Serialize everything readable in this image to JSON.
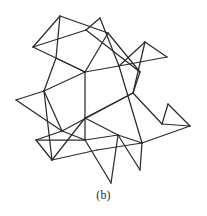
{
  "figure": {
    "caption": "(b)",
    "label": "(b)",
    "title": "",
    "kind": "geometric-line-network",
    "canvas": {
      "width": 207,
      "height": 216
    },
    "style": {
      "stroke_color": "#2b2b2b",
      "stroke_width": 1.25,
      "background_color": "#ffffff",
      "line_cap": "round",
      "line_join": "round"
    },
    "vertices": [
      {
        "id": "v1",
        "x": 60,
        "y": 16
      },
      {
        "id": "v2",
        "x": 100,
        "y": 18
      },
      {
        "id": "v3",
        "x": 33,
        "y": 47
      },
      {
        "id": "v4",
        "x": 86,
        "y": 30
      },
      {
        "id": "v5",
        "x": 108,
        "y": 33
      },
      {
        "id": "v6",
        "x": 145,
        "y": 42
      },
      {
        "id": "v7",
        "x": 167,
        "y": 57
      },
      {
        "id": "v8",
        "x": 140,
        "y": 72
      },
      {
        "id": "v9",
        "x": 56,
        "y": 58
      },
      {
        "id": "v10",
        "x": 85,
        "y": 72
      },
      {
        "id": "v11",
        "x": 119,
        "y": 66
      },
      {
        "id": "v12",
        "x": 16,
        "y": 100
      },
      {
        "id": "v13",
        "x": 44,
        "y": 91
      },
      {
        "id": "v14",
        "x": 133,
        "y": 93
      },
      {
        "id": "v15",
        "x": 85,
        "y": 118
      },
      {
        "id": "v16",
        "x": 168,
        "y": 104
      },
      {
        "id": "v17",
        "x": 190,
        "y": 126
      },
      {
        "id": "v18",
        "x": 162,
        "y": 124
      },
      {
        "id": "v19",
        "x": 36,
        "y": 140
      },
      {
        "id": "v20",
        "x": 85,
        "y": 140
      },
      {
        "id": "v21",
        "x": 118,
        "y": 135
      },
      {
        "id": "v22",
        "x": 62,
        "y": 131
      },
      {
        "id": "v23",
        "x": 52,
        "y": 160
      },
      {
        "id": "v24",
        "x": 97,
        "y": 150
      },
      {
        "id": "v25",
        "x": 111,
        "y": 183
      },
      {
        "id": "v26",
        "x": 140,
        "y": 170
      },
      {
        "id": "v27",
        "x": 142,
        "y": 143
      }
    ],
    "segments": [
      {
        "name": "top-left-triangle-left-edge",
        "x1": 60,
        "y1": 16,
        "x2": 33,
        "y2": 47
      },
      {
        "name": "top-left-triangle-right-edge",
        "x1": 60,
        "y1": 16,
        "x2": 108,
        "y2": 33
      },
      {
        "name": "top-left-triangle-base",
        "x1": 33,
        "y1": 47,
        "x2": 86,
        "y2": 30
      },
      {
        "name": "top-right-triangle-left-edge",
        "x1": 100,
        "y1": 18,
        "x2": 86,
        "y2": 30
      },
      {
        "name": "top-right-triangle-right-edge",
        "x1": 100,
        "y1": 18,
        "x2": 119,
        "y2": 66
      },
      {
        "name": "top-mid-cross-edge",
        "x1": 86,
        "y1": 30,
        "x2": 140,
        "y2": 72
      },
      {
        "name": "upper-left-spur",
        "x1": 60,
        "y1": 16,
        "x2": 56,
        "y2": 58
      },
      {
        "name": "left-diagonal-to-mid",
        "x1": 33,
        "y1": 47,
        "x2": 85,
        "y2": 72
      },
      {
        "name": "upper-left-to-lower-left",
        "x1": 56,
        "y1": 58,
        "x2": 44,
        "y2": 91
      },
      {
        "name": "mid-left-brace",
        "x1": 56,
        "y1": 58,
        "x2": 85,
        "y2": 72
      },
      {
        "name": "left-vertical-run",
        "x1": 44,
        "y1": 91,
        "x2": 85,
        "y2": 72
      },
      {
        "name": "center-vertical-line",
        "x1": 85,
        "y1": 72,
        "x2": 85,
        "y2": 140
      },
      {
        "name": "center-to-upper-right",
        "x1": 85,
        "y1": 72,
        "x2": 119,
        "y2": 66
      },
      {
        "name": "right-upper-triangle-apex-left",
        "x1": 145,
        "y1": 42,
        "x2": 119,
        "y2": 66
      },
      {
        "name": "right-upper-triangle-apex-right",
        "x1": 145,
        "y1": 42,
        "x2": 167,
        "y2": 57
      },
      {
        "name": "right-upper-triangle-base",
        "x1": 167,
        "y1": 57,
        "x2": 119,
        "y2": 66
      },
      {
        "name": "right-descend-from-apex",
        "x1": 145,
        "y1": 42,
        "x2": 133,
        "y2": 93
      },
      {
        "name": "upper-right-cross",
        "x1": 108,
        "y1": 33,
        "x2": 140,
        "y2": 72
      },
      {
        "name": "right-mid-descend",
        "x1": 140,
        "y1": 72,
        "x2": 133,
        "y2": 93
      },
      {
        "name": "right-long-diagonal",
        "x1": 119,
        "y1": 66,
        "x2": 142,
        "y2": 143
      },
      {
        "name": "center-to-right-mid",
        "x1": 85,
        "y1": 118,
        "x2": 133,
        "y2": 93
      },
      {
        "name": "left-far-point-upper",
        "x1": 16,
        "y1": 100,
        "x2": 44,
        "y2": 91
      },
      {
        "name": "left-far-point-lower",
        "x1": 16,
        "y1": 100,
        "x2": 62,
        "y2": 131
      },
      {
        "name": "left-lower-brace",
        "x1": 44,
        "y1": 91,
        "x2": 62,
        "y2": 131
      },
      {
        "name": "left-lower-to-bottom",
        "x1": 44,
        "y1": 91,
        "x2": 52,
        "y2": 160
      },
      {
        "name": "left-bottom-horizontal",
        "x1": 36,
        "y1": 140,
        "x2": 85,
        "y2": 140
      },
      {
        "name": "left-bottom-left-edge",
        "x1": 36,
        "y1": 140,
        "x2": 62,
        "y2": 131
      },
      {
        "name": "mid-left-span",
        "x1": 62,
        "y1": 131,
        "x2": 133,
        "y2": 93
      },
      {
        "name": "bottom-left-triangle-left",
        "x1": 52,
        "y1": 160,
        "x2": 36,
        "y2": 140
      },
      {
        "name": "bottom-left-triangle-right",
        "x1": 52,
        "y1": 160,
        "x2": 97,
        "y2": 150
      },
      {
        "name": "bottom-mid-horizontal",
        "x1": 85,
        "y1": 140,
        "x2": 118,
        "y2": 135
      },
      {
        "name": "bottom-mid-left-edge",
        "x1": 85,
        "y1": 140,
        "x2": 111,
        "y2": 183
      },
      {
        "name": "bottom-mid-right-edge",
        "x1": 118,
        "y1": 135,
        "x2": 111,
        "y2": 183
      },
      {
        "name": "center-to-bottom-left",
        "x1": 85,
        "y1": 118,
        "x2": 52,
        "y2": 160
      },
      {
        "name": "center-to-bottom-node",
        "x1": 85,
        "y1": 118,
        "x2": 118,
        "y2": 135
      },
      {
        "name": "bottom-right-triangle-left",
        "x1": 118,
        "y1": 135,
        "x2": 140,
        "y2": 170
      },
      {
        "name": "bottom-right-triangle-right",
        "x1": 142,
        "y1": 143,
        "x2": 140,
        "y2": 170
      },
      {
        "name": "bottom-right-triangle-top",
        "x1": 118,
        "y1": 135,
        "x2": 142,
        "y2": 143
      },
      {
        "name": "far-right-triangle-left",
        "x1": 168,
        "y1": 104,
        "x2": 162,
        "y2": 124
      },
      {
        "name": "far-right-triangle-right",
        "x1": 168,
        "y1": 104,
        "x2": 190,
        "y2": 126
      },
      {
        "name": "far-right-triangle-base",
        "x1": 162,
        "y1": 124,
        "x2": 190,
        "y2": 126
      },
      {
        "name": "right-connector-to-mesh",
        "x1": 162,
        "y1": 124,
        "x2": 133,
        "y2": 93
      },
      {
        "name": "right-lower-connector",
        "x1": 190,
        "y1": 126,
        "x2": 142,
        "y2": 143
      },
      {
        "name": "lower-left-long-span",
        "x1": 97,
        "y1": 150,
        "x2": 142,
        "y2": 143
      },
      {
        "name": "left-bottom-node-drop",
        "x1": 62,
        "y1": 131,
        "x2": 85,
        "y2": 140
      },
      {
        "name": "top-apex-to-center",
        "x1": 108,
        "y1": 33,
        "x2": 85,
        "y2": 72
      }
    ]
  }
}
